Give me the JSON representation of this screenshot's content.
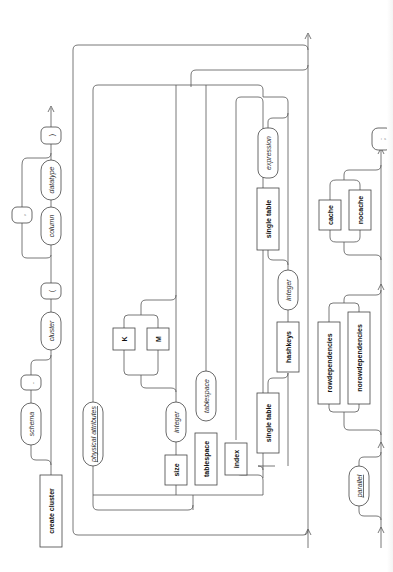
{
  "diagram": {
    "orientation": "rotated -90deg (flow bottom to top)",
    "colors": {
      "line": "#555555",
      "text": "#111111",
      "background": "#ffffff"
    },
    "row1": {
      "create_cluster": "create cluster",
      "schema": "schema",
      "dot": ".",
      "cluster": "cluster",
      "open_paren": "(",
      "column": "column",
      "comma": ",",
      "datatype": "datatype",
      "close_paren": ")"
    },
    "row2": {
      "physical_attributes": "physical attributes",
      "size": "size",
      "size_integer": "integer",
      "unit_k": "K",
      "unit_m": "M",
      "tablespace_kw": "tablespace",
      "tablespace_nt": "tablespace",
      "index": "index",
      "single_table_1": "single table",
      "hashkeys": "hashkeys",
      "hashkeys_integer": "integer",
      "single_table_2": "single table",
      "expression": "expression"
    },
    "row3": {
      "parallel": "parallel",
      "rowdependencies": "rowdependencies",
      "norowdependencies": "norowdependencies",
      "cache": "cache",
      "nocache": "nocache",
      "terminator": ";"
    }
  }
}
